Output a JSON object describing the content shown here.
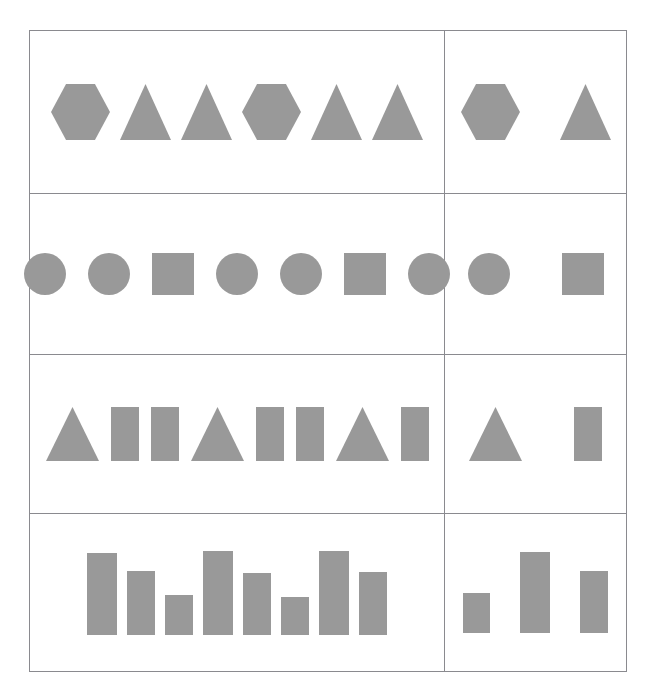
{
  "figure": {
    "kind": "abstract-reasoning-puzzle",
    "background_color": "#ffffff",
    "border_color": "#8a8a8f",
    "shape_fill_color": "#999999",
    "columns": 2,
    "rows": 4,
    "column_roles": [
      "sequence",
      "answer-options"
    ]
  },
  "chart_data": {
    "type": "table",
    "xlabel": "",
    "ylabel": "",
    "grid": true,
    "legend": "none",
    "categories": [
      "Row 1",
      "Row 2",
      "Row 3",
      "Row 4"
    ],
    "series": [
      {
        "name": "sequence-panel",
        "values": [
          6,
          7,
          8,
          8
        ]
      },
      {
        "name": "options-panel",
        "values": [
          2,
          2,
          2,
          3
        ]
      }
    ],
    "rows": [
      {
        "row": 1,
        "sequence": [
          "hexagon",
          "triangle",
          "triangle",
          "hexagon",
          "triangle",
          "triangle"
        ],
        "options": [
          "hexagon",
          "triangle"
        ]
      },
      {
        "row": 2,
        "sequence": [
          "circle",
          "circle",
          "square",
          "circle",
          "circle",
          "square",
          "circle"
        ],
        "options": [
          "circle",
          "square"
        ]
      },
      {
        "row": 3,
        "sequence": [
          "triangle",
          "rectangle",
          "rectangle",
          "triangle",
          "rectangle",
          "rectangle",
          "triangle",
          "rectangle"
        ],
        "options": [
          "triangle",
          "rectangle"
        ]
      },
      {
        "row": 4,
        "sequence": [
          "bar-tall",
          "bar-medium",
          "bar-short",
          "bar-tall",
          "bar-medium",
          "bar-short",
          "bar-tall",
          "bar-medium"
        ],
        "sequence_bar_heights": [
          82,
          64,
          40,
          84,
          62,
          38,
          84,
          63
        ],
        "options": [
          "bar-short",
          "bar-tall",
          "bar-medium"
        ],
        "options_bar_heights": [
          40,
          81,
          62
        ]
      }
    ]
  },
  "rows": [
    {
      "label": "row-1",
      "sequence": [
        {
          "shape": "hexagon",
          "width": 59,
          "height": 56
        },
        {
          "shape": "triangle",
          "width": 51,
          "height": 56
        },
        {
          "shape": "triangle",
          "width": 51,
          "height": 56
        },
        {
          "shape": "hexagon",
          "width": 59,
          "height": 56
        },
        {
          "shape": "triangle",
          "width": 51,
          "height": 56
        },
        {
          "shape": "triangle",
          "width": 51,
          "height": 56
        }
      ],
      "options": [
        {
          "shape": "hexagon",
          "width": 59,
          "height": 56
        },
        {
          "shape": "triangle",
          "width": 51,
          "height": 56
        }
      ]
    },
    {
      "label": "row-2",
      "sequence": [
        {
          "shape": "circle",
          "width": 42,
          "height": 42
        },
        {
          "shape": "circle",
          "width": 42,
          "height": 42
        },
        {
          "shape": "square",
          "width": 42,
          "height": 42
        },
        {
          "shape": "circle",
          "width": 42,
          "height": 42
        },
        {
          "shape": "circle",
          "width": 42,
          "height": 42
        },
        {
          "shape": "square",
          "width": 42,
          "height": 42
        },
        {
          "shape": "circle",
          "width": 42,
          "height": 42
        }
      ],
      "options": [
        {
          "shape": "circle",
          "width": 42,
          "height": 42
        },
        {
          "shape": "square",
          "width": 42,
          "height": 42
        }
      ]
    },
    {
      "label": "row-3",
      "sequence": [
        {
          "shape": "triangle",
          "width": 53,
          "height": 54
        },
        {
          "shape": "rectangle",
          "width": 28,
          "height": 54
        },
        {
          "shape": "rectangle",
          "width": 28,
          "height": 54
        },
        {
          "shape": "triangle",
          "width": 53,
          "height": 54
        },
        {
          "shape": "rectangle",
          "width": 28,
          "height": 54
        },
        {
          "shape": "rectangle",
          "width": 28,
          "height": 54
        },
        {
          "shape": "triangle",
          "width": 53,
          "height": 54
        },
        {
          "shape": "rectangle",
          "width": 28,
          "height": 54
        }
      ],
      "options": [
        {
          "shape": "triangle",
          "width": 53,
          "height": 54
        },
        {
          "shape": "rectangle",
          "width": 28,
          "height": 54
        }
      ]
    },
    {
      "label": "row-4",
      "sequence": [
        {
          "shape": "bar",
          "width": 30,
          "height": 82
        },
        {
          "shape": "bar",
          "width": 28,
          "height": 64
        },
        {
          "shape": "bar",
          "width": 28,
          "height": 40
        },
        {
          "shape": "bar",
          "width": 30,
          "height": 84
        },
        {
          "shape": "bar",
          "width": 28,
          "height": 62
        },
        {
          "shape": "bar",
          "width": 28,
          "height": 38
        },
        {
          "shape": "bar",
          "width": 30,
          "height": 84
        },
        {
          "shape": "bar",
          "width": 28,
          "height": 63
        }
      ],
      "options": [
        {
          "shape": "bar",
          "width": 27,
          "height": 40
        },
        {
          "shape": "bar",
          "width": 30,
          "height": 81
        },
        {
          "shape": "bar",
          "width": 28,
          "height": 62
        }
      ]
    }
  ],
  "layout": {
    "row_heights": [
      164,
      161,
      160,
      157
    ],
    "sequence_cell_width": 415,
    "options_cell_width": 182,
    "sequence_gaps": [
      10,
      22,
      12,
      10
    ],
    "options_gaps": [
      40,
      52,
      52,
      30
    ]
  }
}
